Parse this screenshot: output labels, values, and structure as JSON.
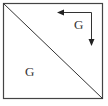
{
  "diagram": {
    "shape": "square divided by diagonal",
    "labels": {
      "upper_triangle": "G",
      "lower_triangle": "G"
    },
    "arrow": {
      "description": "L-shaped arrow: one head pointing left, one head pointing down",
      "heads": [
        "left",
        "down"
      ]
    },
    "colors": {
      "stroke": "#333333",
      "background": "#ffffff"
    }
  }
}
